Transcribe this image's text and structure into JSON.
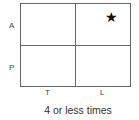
{
  "diagram": {
    "rows": [
      {
        "label": "A"
      },
      {
        "label": "P"
      }
    ],
    "columns": [
      {
        "label": "T"
      },
      {
        "label": "L"
      }
    ],
    "marker": {
      "cell": "A-L",
      "symbol": "★",
      "icon": "star-icon"
    },
    "caption": "4 or less times"
  }
}
